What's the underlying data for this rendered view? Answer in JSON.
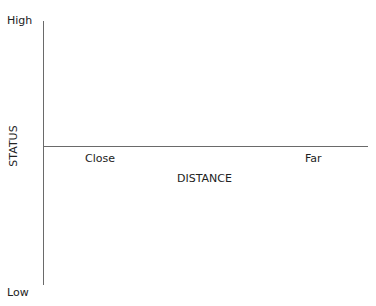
{
  "diagram": {
    "type": "quadrant-axes",
    "y_axis": {
      "title": "STATUS",
      "top_label": "High",
      "bottom_label": "Low"
    },
    "x_axis": {
      "title": "DISTANCE",
      "left_label": "Close",
      "right_label": "Far"
    },
    "colors": {
      "axis_line": "#6a6a6a",
      "text": "#222222",
      "background": "#ffffff"
    }
  }
}
